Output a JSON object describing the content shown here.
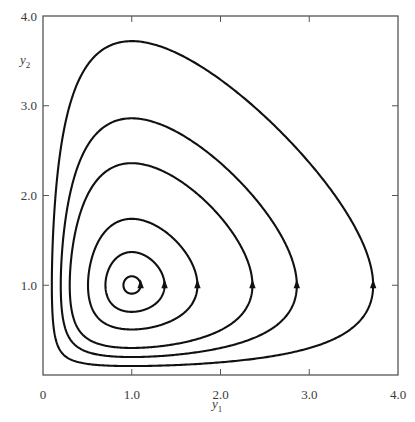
{
  "chart_data": {
    "type": "line",
    "title": "",
    "subtitle": "Phase-plane trajectories (closed orbits about equilibrium at (1,1))",
    "xlabel": "y1",
    "ylabel": "y2",
    "xlim": [
      0,
      4.0
    ],
    "ylim": [
      0,
      4.0
    ],
    "x_ticks": [
      0,
      1.0,
      2.0,
      3.0,
      4.0
    ],
    "x_tick_labels": [
      "0",
      "1.0",
      "2.0",
      "3.0",
      "4.0"
    ],
    "y_ticks": [
      1.0,
      2.0,
      3.0,
      4.0
    ],
    "y_tick_labels": [
      "1.0",
      "2.0",
      "3.0",
      "4.0"
    ],
    "grid": false,
    "legend": null,
    "equilibrium": [
      1.0,
      1.0
    ],
    "arrow_direction": "counterclockwise (upward at right crossing of y2 = 1)",
    "series": [
      {
        "name": "orbit-1",
        "right_crossing_y1": 1.1,
        "left_crossing_y1": 0.9,
        "max_y2": 1.1,
        "min_y2": 0.9
      },
      {
        "name": "orbit-2",
        "right_crossing_y1": 1.37,
        "left_crossing_y1": 0.67,
        "max_y2": 1.37,
        "min_y2": 0.67
      },
      {
        "name": "orbit-3",
        "right_crossing_y1": 1.74,
        "left_crossing_y1": 0.45,
        "max_y2": 1.76,
        "min_y2": 0.45
      },
      {
        "name": "orbit-4",
        "right_crossing_y1": 2.36,
        "left_crossing_y1": 0.27,
        "max_y2": 2.36,
        "min_y2": 0.27
      },
      {
        "name": "orbit-5",
        "right_crossing_y1": 2.86,
        "left_crossing_y1": 0.2,
        "max_y2": 2.85,
        "min_y2": 0.18
      },
      {
        "name": "orbit-6",
        "right_crossing_y1": 3.72,
        "left_crossing_y1": 0.1,
        "max_y2": 3.7,
        "min_y2": 0.1
      }
    ]
  },
  "labels": {
    "y_axis": "y",
    "y_axis_sub": "2",
    "x_axis": "y",
    "x_axis_sub": "1"
  },
  "style": {
    "curve_color": "#111111",
    "axis_color": "#555555"
  }
}
